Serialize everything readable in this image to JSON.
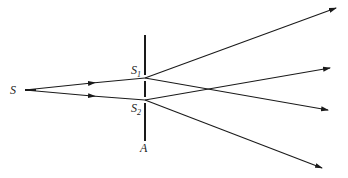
{
  "diagram": {
    "labels": {
      "source": "S",
      "slit1_main": "S",
      "slit1_sub": "1",
      "slit2_main": "S",
      "slit2_sub": "2",
      "barrier": "A"
    },
    "colors": {
      "line": "#1a1a1a",
      "text": "#222222",
      "background": "#ffffff"
    },
    "rays": [
      {
        "from": "S",
        "to": "S1",
        "kind": "incident"
      },
      {
        "from": "S",
        "to": "S2",
        "kind": "incident"
      },
      {
        "from": "S1",
        "direction": "upper-right",
        "kind": "diffracted"
      },
      {
        "from": "S1",
        "direction": "lower-right",
        "kind": "diffracted"
      },
      {
        "from": "S2",
        "direction": "upper-right",
        "kind": "diffracted"
      },
      {
        "from": "S2",
        "direction": "lower-right",
        "kind": "diffracted"
      }
    ]
  }
}
